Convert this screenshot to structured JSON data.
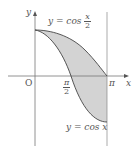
{
  "diagram": {
    "axes": {
      "x_label": "x",
      "y_label": "y",
      "origin_label": "O"
    },
    "ticks": {
      "pi": "π",
      "half_num": "π",
      "half_den": "2"
    },
    "curves": [
      {
        "name": "cos-half",
        "label_prefix": "y = cos",
        "label_num": "x",
        "label_den": "2"
      },
      {
        "name": "cos",
        "label": "y = cos x"
      }
    ],
    "shade_color": "#d3d3d3",
    "line_color": "#444444"
  }
}
